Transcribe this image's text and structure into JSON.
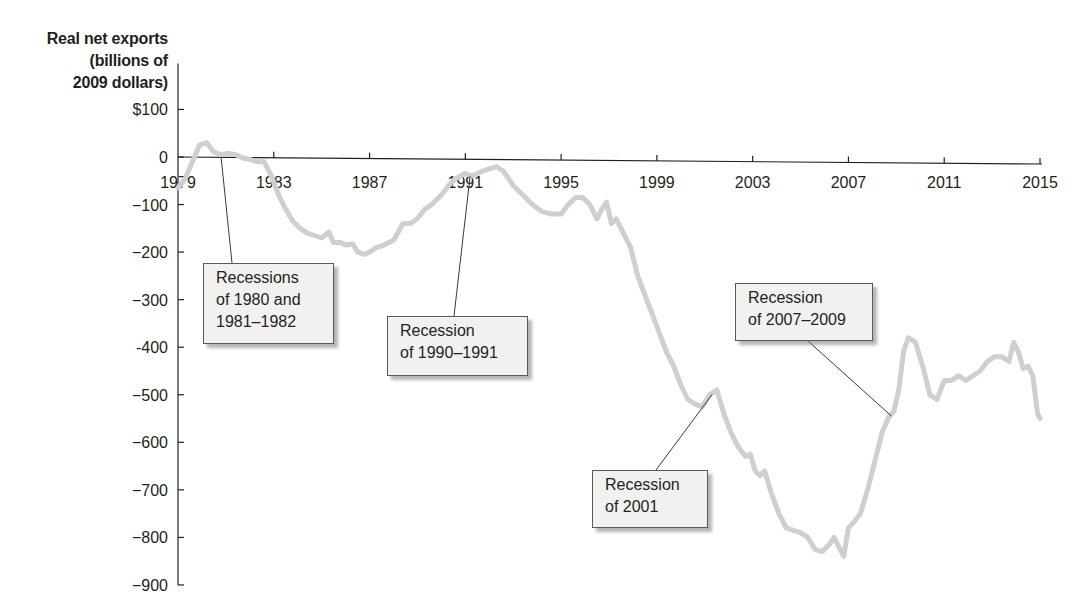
{
  "chart_data": {
    "type": "line",
    "title": "",
    "ylabel": "Real net exports (billions of 2009 dollars)",
    "ylabel_lines": [
      "Real net exports",
      "(billions of",
      "2009 dollars)"
    ],
    "xlabel": "",
    "xlim": [
      1979,
      2015
    ],
    "ylim": [
      -900,
      100
    ],
    "grid": false,
    "legend": null,
    "x_ticks": [
      1979,
      1983,
      1987,
      1991,
      1995,
      1999,
      2003,
      2007,
      2011,
      2015
    ],
    "x_tick_labels": [
      "1979",
      "1983",
      "1987",
      "1991",
      "1995",
      "1999",
      "2003",
      "2007",
      "2011",
      "2015"
    ],
    "y_ticks": [
      100,
      0,
      -100,
      -200,
      -300,
      -400,
      -500,
      -600,
      -700,
      -800,
      -900
    ],
    "y_tick_labels": [
      "$100",
      "0",
      "−100",
      "−200",
      "−300",
      "-400",
      "−500",
      "−600",
      "−700",
      "−800",
      "−900"
    ],
    "series": [
      {
        "name": "Real net exports",
        "color": "#cfcfcf",
        "x": [
          1979.0,
          1979.3,
          1979.6,
          1979.9,
          1980.2,
          1980.5,
          1980.8,
          1981.1,
          1981.4,
          1981.7,
          1982.0,
          1982.3,
          1982.6,
          1982.9,
          1983.2,
          1983.5,
          1983.8,
          1984.1,
          1984.4,
          1984.7,
          1985.0,
          1985.3,
          1985.5,
          1985.8,
          1986.0,
          1986.3,
          1986.5,
          1986.8,
          1987.0,
          1987.3,
          1987.6,
          1988.0,
          1988.4,
          1988.7,
          1989.0,
          1989.3,
          1989.6,
          1990.0,
          1990.3,
          1990.6,
          1991.0,
          1991.3,
          1991.7,
          1992.0,
          1992.3,
          1992.6,
          1993.0,
          1993.4,
          1993.8,
          1994.2,
          1994.6,
          1995.0,
          1995.3,
          1995.6,
          1995.9,
          1996.2,
          1996.5,
          1996.7,
          1996.9,
          1997.1,
          1997.3,
          1997.6,
          1997.9,
          1998.2,
          1998.5,
          1998.8,
          1999.1,
          1999.4,
          1999.7,
          2000.0,
          2000.3,
          2000.6,
          2000.9,
          2001.2,
          2001.5,
          2001.8,
          2002.1,
          2002.4,
          2002.7,
          2002.9,
          2003.1,
          2003.3,
          2003.5,
          2003.8,
          2004.1,
          2004.4,
          2004.7,
          2005.0,
          2005.3,
          2005.6,
          2005.9,
          2006.2,
          2006.4,
          2006.6,
          2006.8,
          2007.0,
          2007.2,
          2007.5,
          2007.8,
          2008.1,
          2008.4,
          2008.7,
          2008.9,
          2009.1,
          2009.3,
          2009.5,
          2009.8,
          2010.1,
          2010.4,
          2010.7,
          2011.0,
          2011.3,
          2011.6,
          2011.9,
          2012.2,
          2012.5,
          2012.8,
          2013.1,
          2013.4,
          2013.7,
          2013.9,
          2014.1,
          2014.3,
          2014.5,
          2014.7,
          2014.9,
          2015.0
        ],
        "values": [
          -65,
          -45,
          -10,
          25,
          30,
          10,
          5,
          8,
          5,
          -2,
          -5,
          -10,
          -10,
          -40,
          -80,
          -110,
          -135,
          -150,
          -160,
          -165,
          -170,
          -158,
          -180,
          -180,
          -185,
          -183,
          -200,
          -205,
          -200,
          -190,
          -185,
          -175,
          -140,
          -140,
          -130,
          -110,
          -100,
          -80,
          -60,
          -45,
          -35,
          -40,
          -30,
          -25,
          -20,
          -30,
          -60,
          -80,
          -100,
          -115,
          -120,
          -120,
          -100,
          -85,
          -85,
          -100,
          -130,
          -110,
          -95,
          -140,
          -130,
          -160,
          -190,
          -250,
          -290,
          -330,
          -370,
          -410,
          -440,
          -480,
          -510,
          -520,
          -525,
          -500,
          -490,
          -540,
          -580,
          -610,
          -630,
          -625,
          -660,
          -670,
          -660,
          -710,
          -750,
          -780,
          -785,
          -790,
          -800,
          -825,
          -830,
          -815,
          -800,
          -820,
          -840,
          -780,
          -770,
          -750,
          -700,
          -640,
          -580,
          -545,
          -535,
          -490,
          -410,
          -380,
          -390,
          -440,
          -500,
          -510,
          -470,
          -470,
          -460,
          -470,
          -460,
          -450,
          -430,
          -420,
          -420,
          -430,
          -390,
          -410,
          -445,
          -440,
          -460,
          -540,
          -550
        ]
      }
    ],
    "annotations": [
      {
        "lines": [
          "Recessions",
          "of 1980 and",
          "1981–1982"
        ],
        "point_year": 1980.8,
        "point_value": 0
      },
      {
        "lines": [
          "Recession",
          "of 1990–1991"
        ],
        "point_year": 1991.2,
        "point_value": -40
      },
      {
        "lines": [
          "Recession",
          "of 2001"
        ],
        "point_year": 2001.3,
        "point_value": -500
      },
      {
        "lines": [
          "Recession",
          "of 2007–2009"
        ],
        "point_year": 2008.8,
        "point_value": -545
      }
    ]
  }
}
